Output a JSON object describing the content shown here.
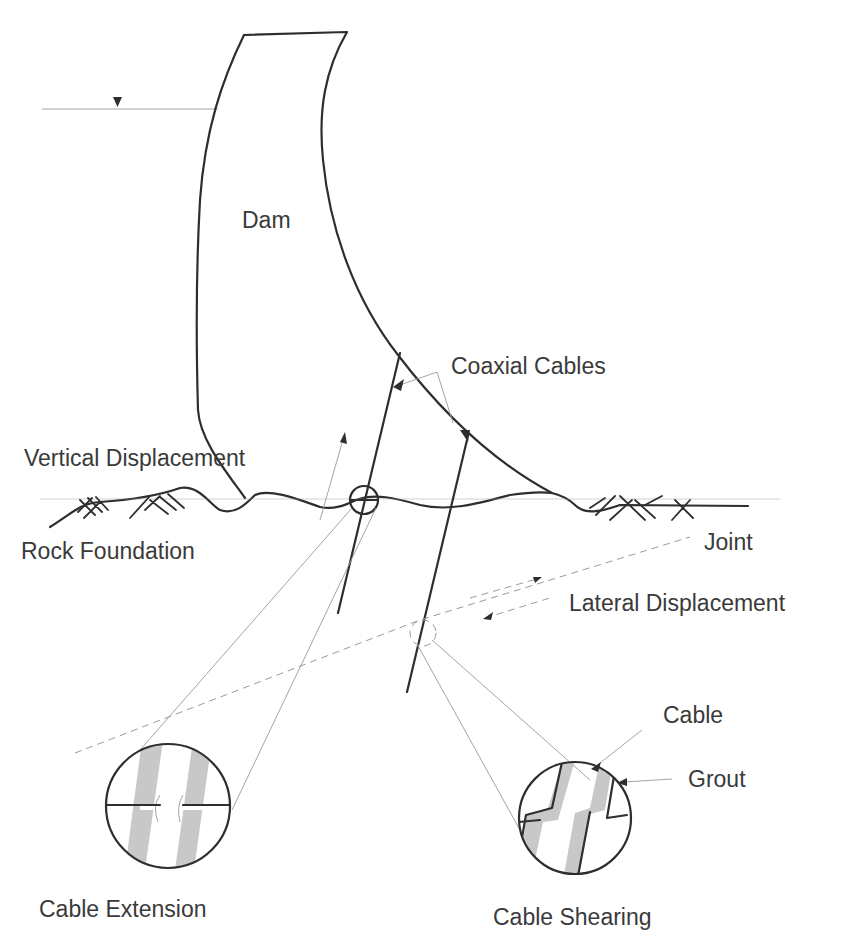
{
  "diagram": {
    "type": "engineering-schematic",
    "colors": {
      "ink": "#2e2e2e",
      "guide_lines": "#9a9a9a",
      "cable_shading": "#c8c8c8",
      "text": "#3a3a3a",
      "background": "#ffffff"
    },
    "labels": {
      "dam": "Dam",
      "coaxial_cables": "Coaxial Cables",
      "vertical_displacement": "Vertical Displacement",
      "rock_foundation": "Rock Foundation",
      "joint": "Joint",
      "lateral_displacement": "Lateral Displacement",
      "cable": "Cable",
      "grout": "Grout",
      "cable_extension": "Cable Extension",
      "cable_shearing": "Cable Shearing"
    },
    "symbols": {
      "water_level": "inverted-triangle-water-level-marker"
    }
  }
}
